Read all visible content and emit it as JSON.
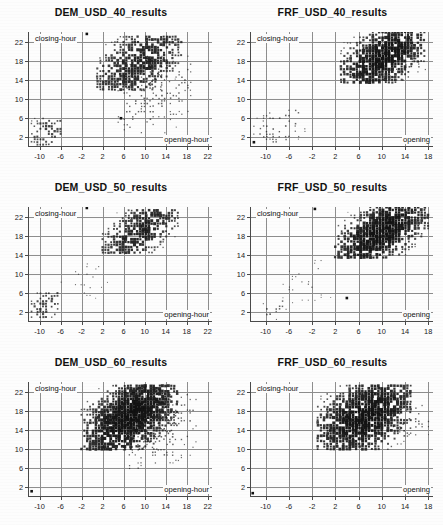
{
  "figure": {
    "layout": "2 columns x 3 rows",
    "background_color": "#fdfdfd",
    "marker_color": "#111111",
    "grid_color": "#8e8e8e",
    "axis_color": "#4a4a4a"
  },
  "axis_labels": {
    "y": "closing-hour",
    "x_full": "opening-hour",
    "x_truncated": "opening"
  },
  "y_ticks": [
    "2",
    "6",
    "10",
    "14",
    "18",
    "22"
  ],
  "x_ticks_left": [
    "-10",
    "-6",
    "-2",
    "2",
    "6",
    "10",
    "14",
    "18",
    "22"
  ],
  "x_ticks_right": [
    "-10",
    "-6",
    "-2",
    "2",
    "6",
    "10",
    "14",
    "18"
  ],
  "chart_data": [
    {
      "type": "scatter",
      "title": "DEM_USD_40_results",
      "xlabel": "opening-hour",
      "ylabel": "closing-hour",
      "xlim": [
        -12,
        23
      ],
      "ylim": [
        0,
        24
      ],
      "xticks": [
        -10,
        -6,
        -2,
        2,
        6,
        10,
        14,
        18,
        22
      ],
      "yticks": [
        2,
        6,
        10,
        14,
        18,
        22
      ],
      "grid": true,
      "legend": "none",
      "description": "Dense diagonal band of variable-size square markers rising from lower-left to upper-right; a large main cloud spans roughly x=2..16, y=13..23, a secondary compact cluster sits near x=-11..-6, y=1..6, plus a faint sparse diagonal tail along x=6..18, y=4..18.",
      "clusters": [
        {
          "name": "main",
          "x_range": [
            1,
            17
          ],
          "y_range": [
            12,
            23.5
          ],
          "density": "high",
          "slope": 1.0
        },
        {
          "name": "low-corner",
          "x_range": [
            -11.5,
            -5.5
          ],
          "y_range": [
            0.5,
            6.5
          ],
          "density": "medium",
          "slope": 1.0
        },
        {
          "name": "sparse-tail",
          "x_range": [
            5,
            19
          ],
          "y_range": [
            3,
            19
          ],
          "density": "low",
          "slope": 1.0
        }
      ],
      "outliers": [
        {
          "x": -1,
          "y": 23.6
        },
        {
          "x": 5.5,
          "y": 6
        }
      ]
    },
    {
      "type": "scatter",
      "title": "FRF_USD_40_results",
      "xlabel": "opening",
      "ylabel": "closing-hour",
      "xlim": [
        -12.5,
        19
      ],
      "ylim": [
        0,
        24
      ],
      "xticks": [
        -10,
        -6,
        -2,
        2,
        6,
        10,
        14,
        18
      ],
      "yticks": [
        2,
        6,
        10,
        14,
        18,
        22
      ],
      "grid": true,
      "legend": "none",
      "description": "Very dense diagonal band concentrated between x=3..17, y=14..24; faint scattered points in the lower-left quadrant and a short sparse diagonal near x=13..17, y=15..19.",
      "clusters": [
        {
          "name": "main",
          "x_range": [
            3,
            17.5
          ],
          "y_range": [
            13.5,
            24
          ],
          "density": "very-high",
          "slope": 1.0
        },
        {
          "name": "sparse-lower",
          "x_range": [
            -12,
            -3
          ],
          "y_range": [
            0.5,
            8
          ],
          "density": "low",
          "slope": 1.0
        },
        {
          "name": "sparse-tail",
          "x_range": [
            12,
            18
          ],
          "y_range": [
            14,
            19
          ],
          "density": "low",
          "slope": 1.0
        }
      ],
      "outliers": [
        {
          "x": -12,
          "y": 1
        }
      ]
    },
    {
      "type": "scatter",
      "title": "DEM_USD_50_results",
      "xlabel": "opening-hour",
      "ylabel": "closing-hour",
      "xlim": [
        -12,
        23
      ],
      "ylim": [
        0,
        24
      ],
      "xticks": [
        -10,
        -6,
        -2,
        2,
        6,
        10,
        14,
        18,
        22
      ],
      "yticks": [
        2,
        6,
        10,
        14,
        18,
        22
      ],
      "grid": true,
      "legend": "none",
      "description": "Two well-separated checkerboard-like diagonal blocks: a large upper block from x=2..16, y=15..23.5 and a small lower-left block from x=-11..-6, y=0.5..6; sparse dotted diagonal connects them.",
      "clusters": [
        {
          "name": "main-upper",
          "x_range": [
            2,
            16.5
          ],
          "y_range": [
            14.5,
            23.5
          ],
          "density": "high",
          "slope": 1.0
        },
        {
          "name": "lower-left",
          "x_range": [
            -11.5,
            -6
          ],
          "y_range": [
            0.5,
            6.5
          ],
          "density": "medium",
          "slope": 1.0
        },
        {
          "name": "connector",
          "x_range": [
            -7,
            3
          ],
          "y_range": [
            5,
            13
          ],
          "density": "very-low",
          "slope": 1.0
        }
      ],
      "outliers": [
        {
          "x": -1,
          "y": 23.8
        }
      ]
    },
    {
      "type": "scatter",
      "title": "FRF_USD_50_results",
      "xlabel": "opening",
      "ylabel": "closing-hour",
      "xlim": [
        -12.5,
        19
      ],
      "ylim": [
        0,
        24
      ],
      "xticks": [
        -10,
        -6,
        -2,
        2,
        6,
        10,
        14,
        18
      ],
      "yticks": [
        2,
        6,
        10,
        14,
        18,
        22
      ],
      "grid": true,
      "legend": "none",
      "description": "Dense diagonal band from x=2..18, y=14..24 with the heaviest concentration near x=6..12, y=16..20; thin sparse diagonal streaks in the lower-left from x=-12..-6, y=0.5..4 and a short tail near x=14..17, y=15..18.",
      "clusters": [
        {
          "name": "main",
          "x_range": [
            2,
            18
          ],
          "y_range": [
            13.5,
            24
          ],
          "density": "very-high",
          "slope": 1.0
        },
        {
          "name": "lower-left",
          "x_range": [
            -12,
            -6
          ],
          "y_range": [
            0.5,
            4.5
          ],
          "density": "low",
          "slope": 1.0
        },
        {
          "name": "sparse-mid",
          "x_range": [
            -7,
            2
          ],
          "y_range": [
            4,
            13
          ],
          "density": "very-low",
          "slope": 1.0
        }
      ],
      "outliers": [
        {
          "x": -1.5,
          "y": 23.6
        },
        {
          "x": 4,
          "y": 5
        }
      ]
    },
    {
      "type": "scatter",
      "title": "DEM_USD_60_results",
      "xlabel": "opening-hour",
      "ylabel": "closing-hour",
      "xlim": [
        -12,
        23
      ],
      "ylim": [
        0,
        24
      ],
      "xticks": [
        -10,
        -6,
        -2,
        2,
        6,
        10,
        14,
        18,
        22
      ],
      "yticks": [
        2,
        6,
        10,
        14,
        18,
        22
      ],
      "grid": true,
      "legend": "none",
      "description": "Single broad dense diagonal band from x=-2..16, y=10..23.5; a clean sparse dotted diagonal line runs parallel below it from about x=6..20, y=6..22.",
      "clusters": [
        {
          "name": "main",
          "x_range": [
            -2,
            16.5
          ],
          "y_range": [
            10,
            23.5
          ],
          "density": "very-high",
          "slope": 1.0
        },
        {
          "name": "parallel-line",
          "x_range": [
            6,
            20
          ],
          "y_range": [
            6,
            22
          ],
          "density": "low",
          "slope": 1.0
        }
      ],
      "outliers": [
        {
          "x": -11.5,
          "y": 1.2
        }
      ]
    },
    {
      "type": "scatter",
      "title": "FRF_USD_60_results",
      "xlabel": "opening",
      "ylabel": "closing-hour",
      "xlim": [
        -12.5,
        19
      ],
      "ylim": [
        0,
        24
      ],
      "xticks": [
        -10,
        -6,
        -2,
        2,
        6,
        10,
        14,
        18
      ],
      "yticks": [
        2,
        6,
        10,
        14,
        18,
        22
      ],
      "grid": true,
      "legend": "none",
      "description": "Broad dense diagonal band from x=-1..15, y=10..23.5 with a separate sparse dotted diagonal from x=12..18, y=13..19.",
      "clusters": [
        {
          "name": "main",
          "x_range": [
            -1,
            15
          ],
          "y_range": [
            10,
            23.5
          ],
          "density": "very-high",
          "slope": 1.0
        },
        {
          "name": "parallel-line",
          "x_range": [
            12,
            18.5
          ],
          "y_range": [
            13,
            19.5
          ],
          "density": "low",
          "slope": 1.0
        }
      ],
      "outliers": [
        {
          "x": -12.2,
          "y": 0.8
        }
      ]
    }
  ]
}
